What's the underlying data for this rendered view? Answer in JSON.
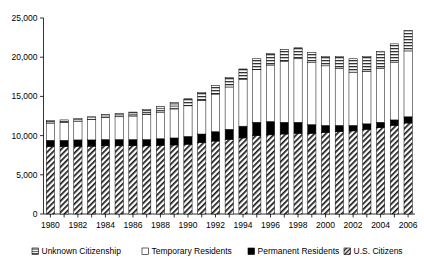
{
  "chart_data": {
    "type": "bar",
    "stacked": true,
    "title": "",
    "subtitle": "",
    "xlabel": "",
    "ylabel": "",
    "ylim": [
      0,
      25000
    ],
    "ytick_values": [
      0,
      5000,
      10000,
      15000,
      20000,
      25000
    ],
    "ytick_labels": [
      "0",
      "5,000",
      "10,000",
      "15,000",
      "20,000",
      "25,000"
    ],
    "grid": false,
    "legend_position": "bottom",
    "categories": [
      "1980",
      "1981",
      "1982",
      "1983",
      "1984",
      "1985",
      "1986",
      "1987",
      "1988",
      "1989",
      "1990",
      "1991",
      "1992",
      "1993",
      "1994",
      "1995",
      "1996",
      "1997",
      "1998",
      "1999",
      "2000",
      "2001",
      "2002",
      "2003",
      "2004",
      "2005",
      "2006"
    ],
    "xtick_labels_shown": [
      "1980",
      "1982",
      "1984",
      "1986",
      "1988",
      "1990",
      "1992",
      "1994",
      "1996",
      "1998",
      "2000",
      "2002",
      "2004",
      "2006"
    ],
    "series": [
      {
        "name": "U.S. Citizens",
        "fill": "diagonal-hatch",
        "values": [
          8600,
          8600,
          8650,
          8650,
          8700,
          8700,
          8700,
          8700,
          8750,
          8800,
          8900,
          9100,
          9300,
          9500,
          9700,
          10000,
          10100,
          10200,
          10300,
          10300,
          10400,
          10500,
          10600,
          10800,
          11000,
          11300,
          11600
        ]
      },
      {
        "name": "Permanent Residents",
        "fill": "solid-black",
        "values": [
          800,
          800,
          800,
          800,
          800,
          800,
          800,
          800,
          850,
          900,
          1000,
          1100,
          1200,
          1300,
          1500,
          1700,
          1700,
          1500,
          1400,
          1100,
          900,
          800,
          700,
          700,
          700,
          700,
          800
        ]
      },
      {
        "name": "Temporary Residents",
        "fill": "white",
        "values": [
          2200,
          2300,
          2400,
          2600,
          2800,
          2900,
          3000,
          3200,
          3400,
          3700,
          3900,
          4300,
          4800,
          5400,
          6000,
          6700,
          7200,
          7800,
          8100,
          7900,
          7600,
          7300,
          6800,
          6700,
          6900,
          7300,
          8400
        ]
      },
      {
        "name": "Unknown Citizenship",
        "fill": "horizontal-stripe",
        "values": [
          300,
          300,
          350,
          350,
          400,
          450,
          500,
          600,
          700,
          800,
          900,
          1000,
          1100,
          1200,
          1300,
          1400,
          1500,
          1500,
          1400,
          1300,
          1200,
          1500,
          1700,
          1900,
          2100,
          2400,
          2600
        ]
      }
    ],
    "legend": [
      {
        "label": "Unknown Citizenship",
        "marker": "horizontal-stripe"
      },
      {
        "label": "Temporary Residents",
        "marker": "white"
      },
      {
        "label": "Permanent Residents",
        "marker": "solid-black"
      },
      {
        "label": "U.S. Citizens",
        "marker": "diagonal-hatch"
      }
    ],
    "colors": {
      "axis": "#000000",
      "text": "#000000",
      "black_segment": "#000000",
      "white_segment": "#ffffff",
      "background": "#ffffff"
    }
  }
}
